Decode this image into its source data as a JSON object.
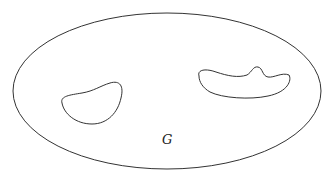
{
  "diagram": {
    "type": "region-with-holes",
    "stroke_color": "#333333",
    "background": "#ffffff",
    "outer_boundary": {
      "shape": "ellipse",
      "cx": 167,
      "cy": 91,
      "rx": 154,
      "ry": 78
    },
    "holes": [
      {
        "name": "left-hole"
      },
      {
        "name": "right-hole"
      }
    ],
    "region_label": "G"
  }
}
